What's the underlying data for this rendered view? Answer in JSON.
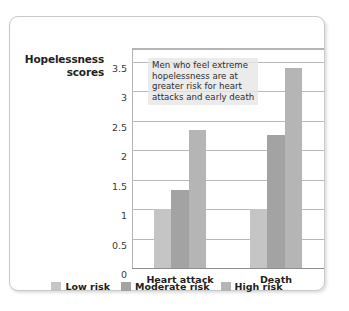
{
  "chart_data": {
    "type": "bar",
    "title": "",
    "xlabel": "",
    "ylabel": "Hopelessness scores",
    "categories": [
      "Heart attack",
      "Death"
    ],
    "series": [
      {
        "name": "Low risk",
        "color": "#c5c5c5",
        "values": [
          1.0,
          1.0
        ]
      },
      {
        "name": "Moderate risk",
        "color": "#a3a3a3",
        "values": [
          1.33,
          2.25
        ]
      },
      {
        "name": "High risk",
        "color": "#b5b5b5",
        "values": [
          2.35,
          3.4
        ]
      }
    ],
    "ylim": [
      0,
      3.75
    ],
    "yticks": [
      "0",
      "0.5",
      "1",
      "1.5",
      "2",
      "2.5",
      "3",
      "3.5"
    ],
    "ytick_values": [
      0,
      0.5,
      1,
      1.5,
      2,
      2.5,
      3,
      3.5
    ],
    "grid": true,
    "legend_position": "bottom",
    "annotation": "Men who feel extreme\nhopelessness are at\ngreater risk for heart\nattacks and early death"
  }
}
